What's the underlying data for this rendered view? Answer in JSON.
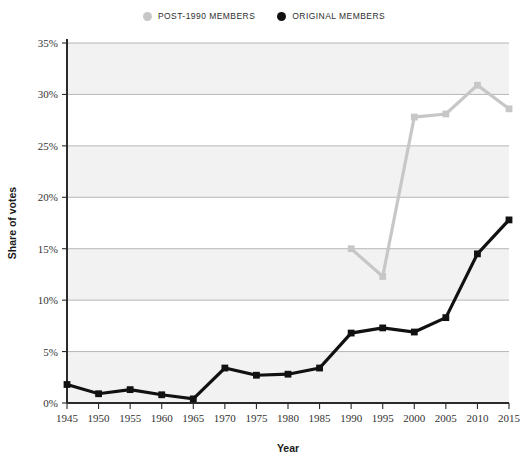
{
  "chart_data": {
    "type": "line",
    "title": "",
    "xlabel": "Year",
    "ylabel": "Share of votes",
    "x": [
      1945,
      1950,
      1955,
      1960,
      1965,
      1970,
      1975,
      1980,
      1985,
      1990,
      1995,
      2000,
      2005,
      2010,
      2015
    ],
    "xlim": [
      1945,
      2015
    ],
    "ylim": [
      0,
      35
    ],
    "ytick_labels": [
      "0%",
      "5%",
      "10%",
      "15%",
      "20%",
      "25%",
      "30%",
      "35%"
    ],
    "ytick_values": [
      0,
      5,
      10,
      15,
      20,
      25,
      30,
      35
    ],
    "xtick_labels": [
      "1945",
      "1950",
      "1955",
      "1960",
      "1965",
      "1970",
      "1975",
      "1980",
      "1985",
      "1990",
      "1995",
      "2000",
      "2005",
      "2010",
      "2015"
    ],
    "grid": true,
    "legend_position": "top-center",
    "series": [
      {
        "name": "POST-1990 MEMBERS",
        "color": "#c7c7c7",
        "marker": "square",
        "x": [
          1990,
          1995,
          2000,
          2005,
          2010,
          2015
        ],
        "values": [
          15.0,
          12.3,
          27.8,
          28.1,
          30.9,
          28.6
        ]
      },
      {
        "name": "ORIGINAL MEMBERS",
        "color": "#111111",
        "marker": "square",
        "x": [
          1945,
          1950,
          1955,
          1960,
          1965,
          1970,
          1975,
          1980,
          1985,
          1990,
          1995,
          2000,
          2005,
          2010,
          2015
        ],
        "values": [
          1.8,
          0.9,
          1.3,
          0.8,
          0.4,
          3.4,
          2.7,
          2.8,
          3.4,
          6.8,
          7.3,
          6.9,
          8.3,
          14.5,
          17.8
        ]
      }
    ]
  },
  "legend": {
    "entries": [
      {
        "label": "POST-1990 MEMBERS",
        "color": "#c7c7c7"
      },
      {
        "label": "ORIGINAL MEMBERS",
        "color": "#111111"
      }
    ]
  }
}
